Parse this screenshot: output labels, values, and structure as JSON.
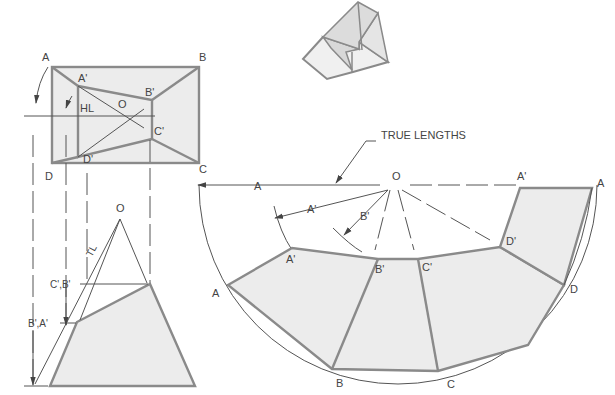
{
  "figure": {
    "type": "sheet-metal development of a truncated pyramid (transition piece)",
    "top_view": {
      "corner_labels": [
        "A",
        "B",
        "C",
        "D"
      ],
      "inner_labels": [
        "A'",
        "B'",
        "C'",
        "D'"
      ],
      "apex_label": "O",
      "hl_label": "HL"
    },
    "front_view": {
      "apex_label": "O",
      "tl_label": "TL",
      "level_labels": [
        "C',B'",
        "B',A'"
      ]
    },
    "pictorial": {
      "description": "isometric view of the frustum"
    },
    "development": {
      "callout": "TRUE LENGTHS",
      "apex_label": "O",
      "true_length_labels": [
        "A",
        "A'",
        "B'",
        "A'"
      ],
      "outer_labels": [
        "A",
        "B",
        "C",
        "D",
        "A"
      ],
      "inner_labels": [
        "A'",
        "B'",
        "C'",
        "D'"
      ],
      "arc_start_label": "C"
    }
  },
  "colors": {
    "face_fill": "#ececec",
    "heavy_line": "#8a8a8a",
    "thin_line": "#555555",
    "text": "#444444"
  }
}
